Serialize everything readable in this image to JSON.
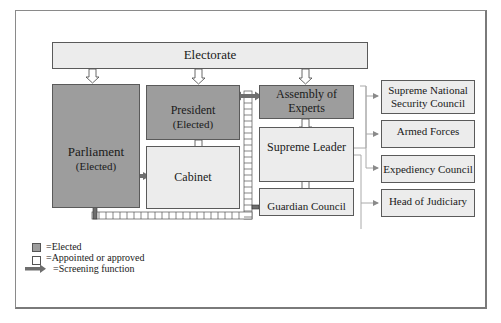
{
  "diagram": {
    "colors": {
      "elected_fill": "#9d9d9d",
      "appointed_fill": "#ececec",
      "border": "#5a5a5a",
      "screening_arrow": "#6e6e6e",
      "connector": "#aaaaaa"
    },
    "nodes": {
      "electorate": {
        "label": "Electorate"
      },
      "parliament": {
        "label": "Parliament",
        "sub": "(Elected)"
      },
      "president": {
        "label": "President",
        "sub": "(Elected)"
      },
      "cabinet": {
        "label": "Cabinet"
      },
      "assembly": {
        "label": "Assembly of Experts",
        "line1": "Assembly of",
        "line2": "Experts"
      },
      "supreme_leader": {
        "label": "Supreme Leader"
      },
      "guardian_council": {
        "label": "Guardian Council"
      },
      "snsc": {
        "label": "Supreme National Security Council",
        "line1": "Supreme National",
        "line2": "Security Council"
      },
      "armed_forces": {
        "label": "Armed Forces"
      },
      "expediency": {
        "label": "Expediency Council"
      },
      "judiciary": {
        "label": "Head of Judiciary"
      }
    },
    "edges": [
      {
        "from": "electorate",
        "to": "parliament",
        "type": "election"
      },
      {
        "from": "electorate",
        "to": "president",
        "type": "election"
      },
      {
        "from": "electorate",
        "to": "assembly",
        "type": "election"
      },
      {
        "from": "president",
        "to": "cabinet",
        "type": "appoint"
      },
      {
        "from": "parliament",
        "to": "cabinet",
        "type": "screening"
      },
      {
        "from": "assembly",
        "to": "supreme_leader",
        "type": "appoint"
      },
      {
        "from": "supreme_leader",
        "to": "guardian_council",
        "type": "appoint"
      },
      {
        "from": "supreme_leader",
        "to": "snsc",
        "type": "appoint"
      },
      {
        "from": "supreme_leader",
        "to": "armed_forces",
        "type": "appoint"
      },
      {
        "from": "supreme_leader",
        "to": "expediency",
        "type": "appoint"
      },
      {
        "from": "supreme_leader",
        "to": "judiciary",
        "type": "appoint"
      },
      {
        "from": "guardian_council",
        "to": "parliament",
        "type": "screening"
      },
      {
        "from": "guardian_council",
        "to": "president",
        "type": "screening"
      },
      {
        "from": "guardian_council",
        "to": "assembly",
        "type": "screening"
      }
    ]
  },
  "legend": {
    "elected": "=Elected",
    "appointed": "=Appointed or approved",
    "screening": "=Screening function"
  }
}
